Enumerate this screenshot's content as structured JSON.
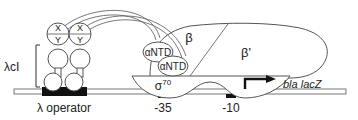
{
  "diagram": {
    "type": "schematic",
    "labels": {
      "lambda_ci": "λcI",
      "lambda_operator": "λ operator",
      "x": "X",
      "y": "Y",
      "antd_1": "αNTD",
      "antd_2": "αNTD",
      "beta": "β",
      "beta_prime": "β'",
      "sigma": "σ",
      "sigma_sup": "70",
      "minus35": "-35",
      "minus10": "-10",
      "reporter": "bla lacZ"
    },
    "colors": {
      "line": "#555555",
      "fill": "#ffffff",
      "operator_block": "#111111",
      "arrow": "#111111"
    }
  }
}
